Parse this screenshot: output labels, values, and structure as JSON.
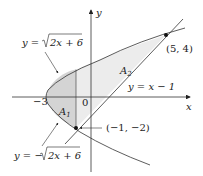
{
  "diagram": {
    "type": "area-between-curves",
    "axes": {
      "x_label": "x",
      "y_label": "y"
    },
    "curves": [
      {
        "id": "upper-parabola",
        "label": "y = √2x + 6",
        "label_parts": {
          "lhs": "y = ",
          "radicand": "2x + 6"
        }
      },
      {
        "id": "lower-parabola",
        "label": "y = −√2x + 6",
        "label_parts": {
          "lhs": "y = −",
          "radicand": "2x + 6"
        }
      },
      {
        "id": "line",
        "label": "y = x − 1"
      }
    ],
    "points": [
      {
        "label": "(5, 4)",
        "x": 5,
        "y": 4
      },
      {
        "label": "(−1, −2)",
        "x": -1,
        "y": -2
      }
    ],
    "tick_labels": {
      "neg3": "−3",
      "zero": "0"
    },
    "regions": [
      {
        "label": "A",
        "sub": "1"
      },
      {
        "label": "A",
        "sub": "2"
      }
    ],
    "colors": {
      "region_fill": "#d9d9d9",
      "region_fill_light": "#ececec",
      "stroke": "#333333"
    }
  }
}
